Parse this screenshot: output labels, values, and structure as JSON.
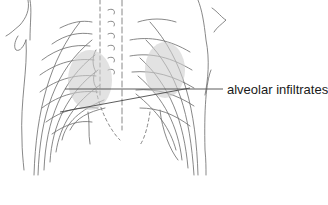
{
  "figure": {
    "annotations": [
      {
        "label": "alveolar infiltrates",
        "x": 227,
        "y": 84
      }
    ],
    "colors": {
      "background": "#ffffff",
      "line": "#555555",
      "label_text": "#1a1a1a"
    }
  }
}
